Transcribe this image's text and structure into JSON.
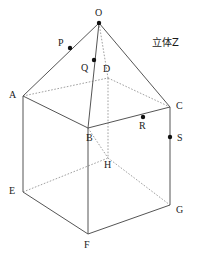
{
  "figure": {
    "caption": "立体Z",
    "caption_position": {
      "x": 152,
      "y": 38
    },
    "stroke_color": "#555555",
    "dash_color": "#888888",
    "point_color": "#111111",
    "label_color": "#1a1a1a",
    "background": "#ffffff",
    "width": 199,
    "height": 257
  },
  "vertices": [
    {
      "name": "O",
      "x": 99,
      "y": 23,
      "label_x": 95,
      "label_y": 8,
      "dot": true,
      "role": "apex"
    },
    {
      "name": "A",
      "x": 23,
      "y": 96,
      "label_x": 9,
      "label_y": 90,
      "dot": false,
      "role": "top-face"
    },
    {
      "name": "B",
      "x": 88,
      "y": 128,
      "label_x": 86,
      "label_y": 133,
      "dot": false,
      "role": "top-face"
    },
    {
      "name": "C",
      "x": 170,
      "y": 107,
      "label_x": 176,
      "label_y": 101,
      "dot": false,
      "role": "top-face"
    },
    {
      "name": "D",
      "x": 108,
      "y": 78,
      "label_x": 103,
      "label_y": 64,
      "dot": false,
      "role": "top-face-hidden"
    },
    {
      "name": "E",
      "x": 23,
      "y": 192,
      "label_x": 9,
      "label_y": 186,
      "dot": false,
      "role": "bottom-face"
    },
    {
      "name": "F",
      "x": 88,
      "y": 234,
      "label_x": 84,
      "label_y": 240,
      "dot": false,
      "role": "bottom-face"
    },
    {
      "name": "G",
      "x": 170,
      "y": 205,
      "label_x": 176,
      "label_y": 205,
      "dot": false,
      "role": "bottom-face"
    },
    {
      "name": "H",
      "x": 108,
      "y": 158,
      "label_x": 104,
      "label_y": 160,
      "dot": false,
      "role": "bottom-face-hidden"
    }
  ],
  "marked_points": [
    {
      "name": "P",
      "x": 70,
      "y": 48,
      "label_x": 58,
      "label_y": 38,
      "on_segment": "O-A"
    },
    {
      "name": "Q",
      "x": 94,
      "y": 60,
      "label_x": 81,
      "label_y": 63,
      "on_segment": "O-B"
    },
    {
      "name": "R",
      "x": 143,
      "y": 117,
      "label_x": 139,
      "label_y": 121,
      "on_segment": "B-C"
    },
    {
      "name": "S",
      "x": 170,
      "y": 137,
      "label_x": 177,
      "label_y": 133,
      "on_segment": "C-G"
    }
  ],
  "edges_solid": [
    {
      "name": "O-A",
      "from": "O",
      "to": "A"
    },
    {
      "name": "O-B",
      "from": "O",
      "to": "B"
    },
    {
      "name": "O-C",
      "from": "O",
      "to": "C"
    },
    {
      "name": "A-B",
      "from": "A",
      "to": "B"
    },
    {
      "name": "B-C",
      "from": "B",
      "to": "C"
    },
    {
      "name": "A-E",
      "from": "A",
      "to": "E"
    },
    {
      "name": "B-F",
      "from": "B",
      "to": "F"
    },
    {
      "name": "C-G",
      "from": "C",
      "to": "G"
    },
    {
      "name": "E-F",
      "from": "E",
      "to": "F"
    },
    {
      "name": "F-G",
      "from": "F",
      "to": "G"
    }
  ],
  "edges_dashed": [
    {
      "name": "O-D",
      "from": "O",
      "to": "D"
    },
    {
      "name": "A-D",
      "from": "A",
      "to": "D"
    },
    {
      "name": "D-C",
      "from": "D",
      "to": "C"
    },
    {
      "name": "D-H",
      "from": "D",
      "to": "H"
    },
    {
      "name": "E-H",
      "from": "E",
      "to": "H"
    },
    {
      "name": "H-G",
      "from": "H",
      "to": "G"
    },
    {
      "name": "B-H",
      "from": "B",
      "to": "H"
    }
  ]
}
